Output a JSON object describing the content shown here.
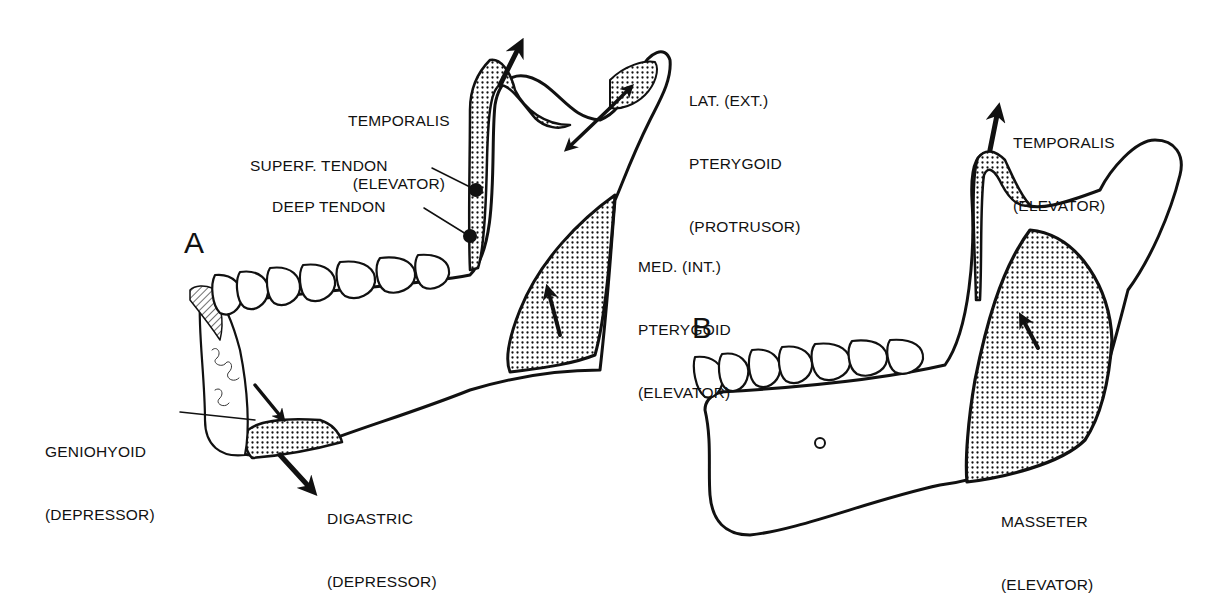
{
  "figure": {
    "panel_a": {
      "letter": "A",
      "labels": {
        "temporalis": [
          "TEMPORALIS",
          "(ELEVATOR)"
        ],
        "lat_pterygoid": [
          "LAT. (EXT.)",
          "PTERYGOID",
          "(PROTRUSOR)"
        ],
        "superf_tendon": "SUPERF. TENDON",
        "deep_tendon": "DEEP TENDON",
        "med_pterygoid": [
          "MED. (INT.)",
          "PTERYGOID",
          "(ELEVATOR)"
        ],
        "geniohyoid": [
          "GENIOHYOID",
          "(DEPRESSOR)"
        ],
        "digastric": [
          "DIGASTRIC",
          "(DEPRESSOR)"
        ]
      }
    },
    "panel_b": {
      "letter": "B",
      "labels": {
        "temporalis": [
          "TEMPORALIS",
          "(ELEVATOR)"
        ],
        "masseter": [
          "MASSETER",
          "(ELEVATOR)"
        ]
      }
    },
    "colors": {
      "ink": "#111111",
      "background": "#ffffff",
      "stipple": "#111111"
    }
  }
}
